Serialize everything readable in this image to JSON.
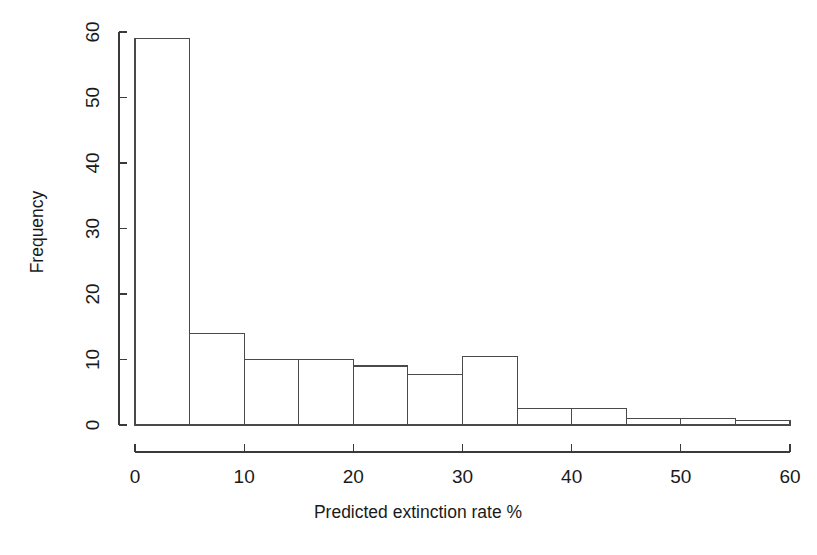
{
  "chart_data": {
    "type": "bar",
    "subtype": "histogram",
    "title": "",
    "xlabel": "Predicted extinction rate %",
    "ylabel": "Frequency",
    "xlim": [
      0,
      60
    ],
    "ylim": [
      0,
      60
    ],
    "bin_width": 5,
    "grid": false,
    "legend": null,
    "categories": [
      "0-5",
      "5-10",
      "10-15",
      "15-20",
      "20-25",
      "25-30",
      "30-35",
      "35-40",
      "40-45",
      "45-50",
      "50-55",
      "55-60"
    ],
    "bin_edges": [
      0,
      5,
      10,
      15,
      20,
      25,
      30,
      35,
      40,
      45,
      50,
      55,
      60
    ],
    "values": [
      59,
      14,
      10,
      10,
      9,
      7.7,
      10.5,
      2.5,
      2.5,
      1,
      1,
      0.7
    ],
    "xticks": [
      0,
      10,
      20,
      30,
      40,
      50,
      60
    ],
    "xtick_labels": [
      "0",
      "10",
      "20",
      "30",
      "40",
      "50",
      "60"
    ],
    "yticks": [
      0,
      10,
      20,
      30,
      40,
      50,
      60
    ],
    "ytick_labels": [
      "0",
      "10",
      "20",
      "30",
      "40",
      "50",
      "60"
    ],
    "bar_fill": "#ffffff",
    "bar_stroke": "#4a4a4a",
    "axis_color": "#3a3a3a",
    "background": "#ffffff"
  },
  "axes": {
    "x_title": "Predicted extinction rate %",
    "y_title": "Frequency"
  }
}
